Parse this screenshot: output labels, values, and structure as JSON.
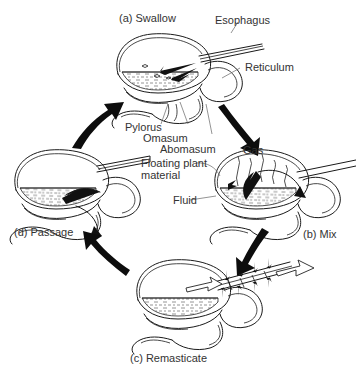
{
  "figure": {
    "background_color": "#ffffff",
    "ink_color": "#1a1a1a",
    "text_color": "#333333"
  },
  "stages": [
    {
      "id": "a",
      "label": "(a) Swallow",
      "position": "top"
    },
    {
      "id": "b",
      "label": "(b) Mix",
      "position": "right"
    },
    {
      "id": "c",
      "label": "(c) Remasticate",
      "position": "bottom"
    },
    {
      "id": "d",
      "label": "(d) Passage",
      "position": "left"
    }
  ],
  "anatomy_labels": [
    {
      "name": "esophagus",
      "text": "Esophagus"
    },
    {
      "name": "reticulum",
      "text": "Reticulum"
    },
    {
      "name": "pylorus",
      "text": "Pylorus"
    },
    {
      "name": "omasum",
      "text": "Omasum"
    },
    {
      "name": "abomasum",
      "text": "Abomasum"
    },
    {
      "name": "floating-plant-material",
      "text": "Floating plant material"
    },
    {
      "name": "fluid",
      "text": "Fluid"
    },
    {
      "name": "gas",
      "text": "Gas"
    }
  ],
  "cycle_arrows": [
    {
      "from": "d",
      "to": "a",
      "direction": "up-right"
    },
    {
      "from": "a",
      "to": "b",
      "direction": "down-right"
    },
    {
      "from": "b",
      "to": "c",
      "direction": "down-left"
    },
    {
      "from": "c",
      "to": "d",
      "direction": "up-left"
    }
  ]
}
